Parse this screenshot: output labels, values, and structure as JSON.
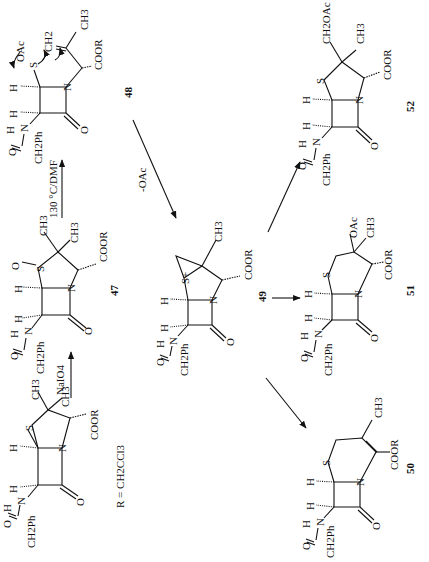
{
  "scheme": {
    "orientation": "rotated 90 degrees counter-clockwise",
    "compounds": [
      {
        "id": "start",
        "label": "",
        "substituents": [
          "CH3",
          "CH3",
          "COOR",
          "S",
          "N",
          "O",
          "H",
          "H",
          "H",
          "N",
          "O",
          "CH2Ph"
        ]
      },
      {
        "id": "47",
        "label": "47",
        "substituents": [
          "CH3",
          "CH3",
          "COOR",
          "S",
          "O",
          "N",
          "O",
          "H",
          "H",
          "H",
          "N",
          "O",
          "CH2Ph"
        ]
      },
      {
        "id": "48",
        "label": "48",
        "substituents": [
          "CH2",
          "CH3",
          "COOR",
          "S",
          "OAc",
          "N",
          "O",
          "H",
          "H",
          "H",
          "N",
          "O",
          "CH2Ph"
        ]
      },
      {
        "id": "49",
        "label": "49",
        "substituents": [
          "S+",
          "CH3",
          "COOR",
          "N",
          "O",
          "H",
          "H",
          "H",
          "N",
          "O",
          "CH2Ph"
        ]
      },
      {
        "id": "50",
        "label": "50",
        "substituents": [
          "S",
          "CH3",
          "COOR",
          "N",
          "O",
          "H",
          "H",
          "H",
          "N",
          "O",
          "CH2Ph"
        ]
      },
      {
        "id": "51",
        "label": "51",
        "substituents": [
          "S",
          "OAc",
          "CH3",
          "COOR",
          "N",
          "O",
          "H",
          "H",
          "H",
          "N",
          "O",
          "CH2Ph"
        ]
      },
      {
        "id": "52",
        "label": "52",
        "substituents": [
          "S",
          "CH2OAc",
          "CH3",
          "COOR",
          "N",
          "O",
          "H",
          "H",
          "H",
          "N",
          "O",
          "CH2Ph"
        ]
      }
    ],
    "reagents": {
      "step1": "NaIO4",
      "step2": "130 °C/DMF",
      "step3": "-OAc"
    },
    "footnote": "R = CH2CCl3",
    "text": {
      "ch3": "CH3",
      "ch2": "CH2",
      "coor": "COOR",
      "s": "S",
      "s_plus": "S+",
      "n": "N",
      "o": "O",
      "h": "H",
      "ch2ph": "CH2Ph",
      "oac": "OAc",
      "ch2oac": "CH2OAc"
    }
  }
}
